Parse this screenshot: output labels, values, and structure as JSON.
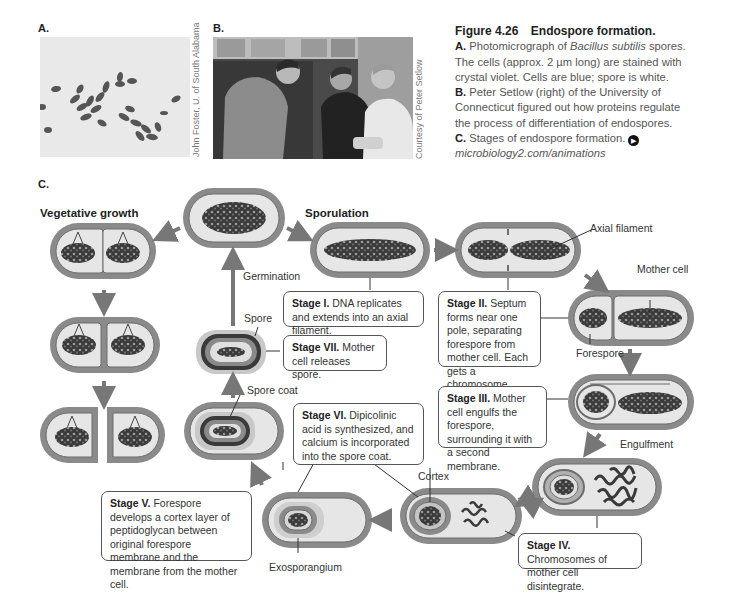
{
  "panels": {
    "a": {
      "label": "A.",
      "credit": "John Foster, U. of South Alabama"
    },
    "b": {
      "label": "B.",
      "credit": "Courtesy of Peter Setlow"
    },
    "c": {
      "label": "C."
    }
  },
  "caption": {
    "figure_number": "Figure 4.26",
    "figure_title": "Endospore formation.",
    "lines": [
      {
        "lead": "A.",
        "text_before": " Photomicrograph of ",
        "italic": "Bacillus subtilis",
        "text_after": " spores."
      },
      {
        "text": "The cells (approx. 2 µm long) are stained with"
      },
      {
        "text": "crystal violet. Cells are blue; spore is white."
      },
      {
        "lead": "B.",
        "text": " Peter Setlow (right) of the University of"
      },
      {
        "text": "Connecticut figured out how proteins regulate"
      },
      {
        "text": "the process of differentiation of endospores."
      },
      {
        "lead": "C.",
        "text": " Stages of endospore formation."
      }
    ],
    "animation_icon": "play-audio-icon",
    "link": "microbiology2.com/animations"
  },
  "diagram": {
    "section_titles": {
      "vegetative": "Vegetative growth",
      "sporulation": "Sporulation"
    },
    "labels": {
      "germination": "Germination",
      "axial_filament": "Axial filament",
      "mother_cell": "Mother cell",
      "forespore": "Forespore",
      "spore": "Spore",
      "spore_coat": "Spore coat",
      "engulfment": "Engulfment",
      "cortex": "Cortex",
      "exosporangium": "Exosporangium"
    },
    "stages": [
      {
        "id": "I",
        "title": "Stage I.",
        "text": " DNA replicates and extends into an axial filament."
      },
      {
        "id": "II",
        "title": "Stage II.",
        "text": "  Septum forms near one pole, separating forespore from mother cell. Each gets a chromosome."
      },
      {
        "id": "III",
        "title": "Stage III.",
        "text": " Mother cell engulfs the forespore, surrounding it with a second membrane."
      },
      {
        "id": "IV",
        "title": "Stage IV.",
        "text": " Chromosomes of mother cell disintegrate."
      },
      {
        "id": "V",
        "title": "Stage V.",
        "text": " Forespore develops a cortex layer of peptidoglycan between original forespore membrane and the membrane from the mother cell."
      },
      {
        "id": "VI",
        "title": "Stage VI.",
        "text": " Dipicolinic acid is synthesized, and calcium is incorporated into the spore coat."
      },
      {
        "id": "VII",
        "title": "Stage VII.",
        "text": " Mother cell releases spore."
      }
    ],
    "colors": {
      "cell_wall": "#8a8a8a",
      "cell_wall_dark": "#6d6d6d",
      "cytoplasm": "#e6e6e6",
      "dna": "#3a3a3a",
      "arrow": "#777777",
      "spore_halo": "#c8c8c8"
    }
  }
}
